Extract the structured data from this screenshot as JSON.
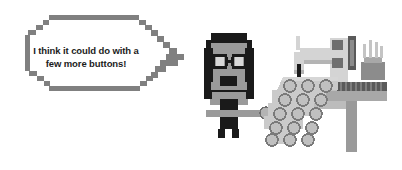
{
  "scene": {
    "title": "Pixel art comic panel",
    "width": 402,
    "height": 170,
    "background_color": "#ffffff"
  },
  "speech_bubble": {
    "text": "I think it could do with a few more buttons!",
    "border_color": "#808080",
    "fill_color": "#ffffff",
    "text_color": "#1c1c1c",
    "tail_direction": "right"
  },
  "character": {
    "name": "person-with-glasses",
    "hair_color": "#1a1a1a",
    "face_color": "#9a9a9a",
    "body_color": "#1a1a1a",
    "glasses_color": "#1a1a1a",
    "glasses_lens_color": "#d8d8d8",
    "mouth_color": "#1a1a1a",
    "arm_color": "#9a9a9a",
    "holds": "rod-with-ball"
  },
  "sewing_machine": {
    "name": "sewing-machine",
    "body_color": "#d4d4d4",
    "shadow_color": "#b4b4b4",
    "needle_color": "#1a1a1a",
    "wheel_color": "#6e6e6e",
    "spool_color": "#8c8c8c",
    "table_color": "#a8a8a8",
    "table_band_color": "#5a5a5a",
    "leg_color": "#9a9a9a",
    "thread_count": 4
  },
  "fabric": {
    "name": "fabric-with-buttons",
    "fabric_color": "#cacaca",
    "button_fill_color": "#c0c0c0",
    "button_outline_color": "#7a7a7a",
    "button_rows": 5,
    "button_columns": 3,
    "button_total": 15
  },
  "palette": {
    "near_black": "#1a1a1a",
    "dark_gray": "#5a5a5a",
    "mid_gray": "#808080",
    "light_gray": "#c8c8c8",
    "white": "#ffffff"
  }
}
